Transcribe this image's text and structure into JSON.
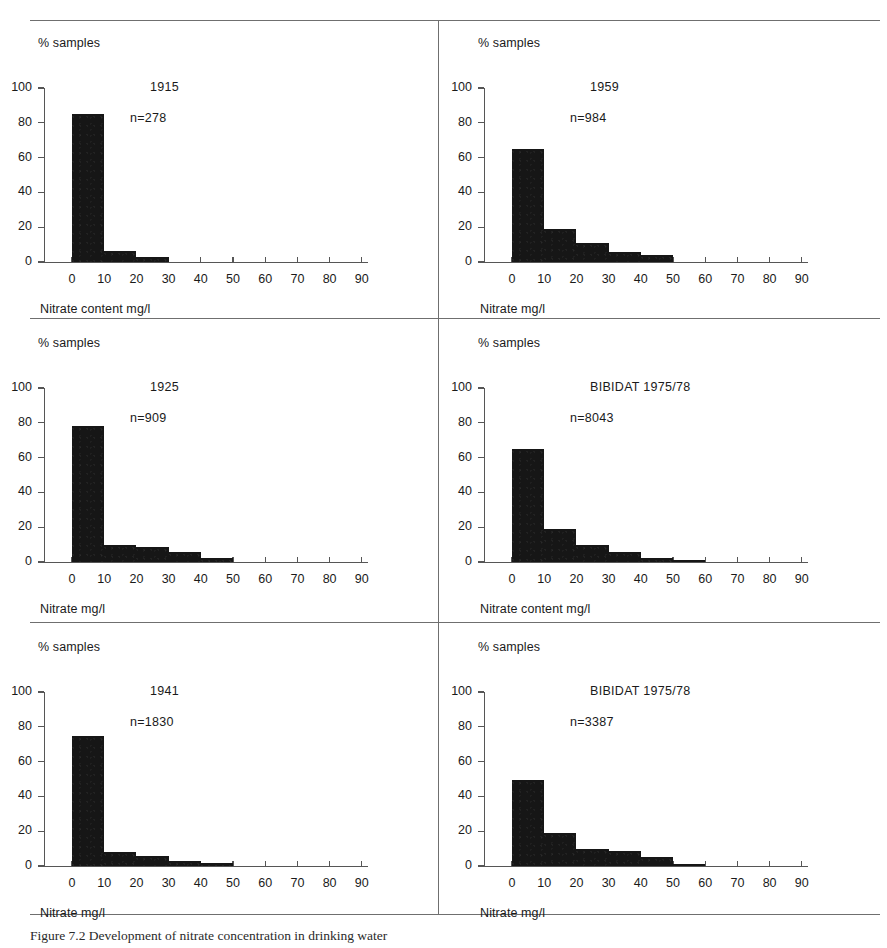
{
  "figure": {
    "caption": "Figure 7.2   Development of nitrate concentration in drinking water",
    "caption_label": "Figure 7.2"
  },
  "axes_common": {
    "ylabel": "% samples",
    "y_ticks": [
      "0",
      "20",
      "40",
      "60",
      "80",
      "100"
    ],
    "y_values": [
      0,
      20,
      40,
      60,
      80,
      100
    ],
    "x_ticks": [
      "0",
      "10",
      "20",
      "30",
      "40",
      "50",
      "60",
      "70",
      "80",
      "90"
    ],
    "x_values": [
      0,
      10,
      20,
      30,
      40,
      50,
      60,
      70,
      80,
      90
    ],
    "ylim": [
      0,
      100
    ],
    "xlim": [
      0,
      90
    ],
    "bar_color": "#161616",
    "axis_color": "#565656",
    "rule_color": "#6f6f6f"
  },
  "panels": [
    {
      "id": "panel-1915",
      "title": "1915",
      "n_label": "n=278",
      "xlabel": "Nitrate content mg/l",
      "ylabel": "% samples",
      "bin_edges": [
        0,
        10,
        20,
        30
      ],
      "values": [
        85,
        6.5,
        3
      ]
    },
    {
      "id": "panel-1959",
      "title": "1959",
      "n_label": "n=984",
      "xlabel": "Nitrate mg/l",
      "ylabel": "% samples",
      "bin_edges": [
        0,
        10,
        20,
        30,
        40,
        50
      ],
      "values": [
        65,
        19,
        11,
        6,
        4
      ]
    },
    {
      "id": "panel-1925",
      "title": "1925",
      "n_label": "n=909",
      "xlabel": "Nitrate mg/l",
      "ylabel": "% samples",
      "bin_edges": [
        0,
        10,
        20,
        30,
        40,
        50
      ],
      "values": [
        78,
        10,
        8.5,
        6,
        2.5
      ]
    },
    {
      "id": "panel-bibidat-8043",
      "title": "BIBIDAT 1975/78",
      "n_label": "n=8043",
      "xlabel": "Nitrate content mg/l",
      "ylabel": "% samples",
      "bin_edges": [
        0,
        10,
        20,
        30,
        40,
        50,
        60
      ],
      "values": [
        65,
        19,
        10,
        5.5,
        2.5,
        1
      ]
    },
    {
      "id": "panel-1941",
      "title": "1941",
      "n_label": "n=1830",
      "xlabel": "Nitrate mg/l",
      "ylabel": "% samples",
      "bin_edges": [
        0,
        10,
        20,
        30,
        40,
        50
      ],
      "values": [
        75,
        8,
        5.5,
        3,
        1.5
      ]
    },
    {
      "id": "panel-bibidat-3387",
      "title": "BIBIDAT 1975/78",
      "n_label": "n=3387",
      "xlabel": "Nitrate mg/l",
      "ylabel": "% samples",
      "bin_edges": [
        0,
        10,
        20,
        30,
        40,
        50,
        60
      ],
      "values": [
        49.5,
        19,
        10,
        8.5,
        5,
        1
      ]
    }
  ],
  "chart_data": [
    {
      "type": "bar",
      "title": "1915",
      "annotation": "n=278",
      "xlabel": "Nitrate content mg/l",
      "ylabel": "% samples",
      "categories": [
        "0-10",
        "10-20",
        "20-30",
        "30-40",
        "40-50",
        "50-60",
        "60-70",
        "70-80",
        "80-90"
      ],
      "values": [
        85,
        6.5,
        3,
        0,
        0,
        0,
        0,
        0,
        0
      ],
      "xlim": [
        0,
        90
      ],
      "ylim": [
        0,
        100
      ],
      "grid": false,
      "legend": "none"
    },
    {
      "type": "bar",
      "title": "1959",
      "annotation": "n=984",
      "xlabel": "Nitrate mg/l",
      "ylabel": "% samples",
      "categories": [
        "0-10",
        "10-20",
        "20-30",
        "30-40",
        "40-50",
        "50-60",
        "60-70",
        "70-80",
        "80-90"
      ],
      "values": [
        65,
        19,
        11,
        6,
        4,
        0,
        0,
        0,
        0
      ],
      "xlim": [
        0,
        90
      ],
      "ylim": [
        0,
        100
      ],
      "grid": false,
      "legend": "none"
    },
    {
      "type": "bar",
      "title": "1925",
      "annotation": "n=909",
      "xlabel": "Nitrate mg/l",
      "ylabel": "% samples",
      "categories": [
        "0-10",
        "10-20",
        "20-30",
        "30-40",
        "40-50",
        "50-60",
        "60-70",
        "70-80",
        "80-90"
      ],
      "values": [
        78,
        10,
        8.5,
        6,
        2.5,
        0,
        0,
        0,
        0
      ],
      "xlim": [
        0,
        90
      ],
      "ylim": [
        0,
        100
      ],
      "grid": false,
      "legend": "none"
    },
    {
      "type": "bar",
      "title": "BIBIDAT 1975/78",
      "annotation": "n=8043",
      "xlabel": "Nitrate content mg/l",
      "ylabel": "% samples",
      "categories": [
        "0-10",
        "10-20",
        "20-30",
        "30-40",
        "40-50",
        "50-60",
        "60-70",
        "70-80",
        "80-90"
      ],
      "values": [
        65,
        19,
        10,
        5.5,
        2.5,
        1,
        0,
        0,
        0
      ],
      "xlim": [
        0,
        90
      ],
      "ylim": [
        0,
        100
      ],
      "grid": false,
      "legend": "none"
    },
    {
      "type": "bar",
      "title": "1941",
      "annotation": "n=1830",
      "xlabel": "Nitrate mg/l",
      "ylabel": "% samples",
      "categories": [
        "0-10",
        "10-20",
        "20-30",
        "30-40",
        "40-50",
        "50-60",
        "60-70",
        "70-80",
        "80-90"
      ],
      "values": [
        75,
        8,
        5.5,
        3,
        1.5,
        0,
        0,
        0,
        0
      ],
      "xlim": [
        0,
        90
      ],
      "ylim": [
        0,
        100
      ],
      "grid": false,
      "legend": "none"
    },
    {
      "type": "bar",
      "title": "BIBIDAT 1975/78",
      "annotation": "n=3387",
      "xlabel": "Nitrate mg/l",
      "ylabel": "% samples",
      "categories": [
        "0-10",
        "10-20",
        "20-30",
        "30-40",
        "40-50",
        "50-60",
        "60-70",
        "70-80",
        "80-90"
      ],
      "values": [
        49.5,
        19,
        10,
        8.5,
        5,
        1,
        0,
        0,
        0
      ],
      "xlim": [
        0,
        90
      ],
      "ylim": [
        0,
        100
      ],
      "grid": false,
      "legend": "none"
    }
  ]
}
